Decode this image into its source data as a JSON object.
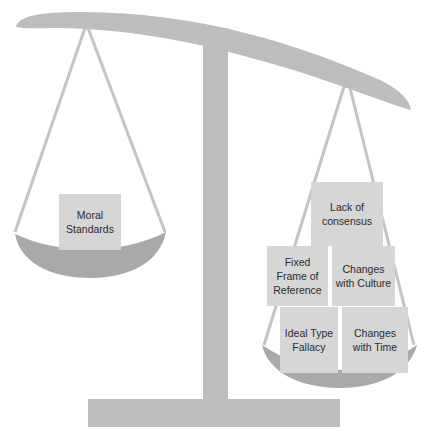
{
  "diagram": {
    "type": "balance-scale",
    "colors": {
      "structure": "#bdbdbd",
      "bowl": "#a9a9a9",
      "box": "#d6d6d6",
      "text": "#2b2b2b"
    },
    "left_pan": {
      "label": "Moral Standards",
      "boxes": [
        {
          "text": "Moral Standards"
        }
      ]
    },
    "right_pan": {
      "boxes": [
        {
          "text": "Lack of consensus"
        },
        {
          "text": "Fixed Frame of Reference"
        },
        {
          "text": "Changes with Culture"
        },
        {
          "text": "Ideal Type Fallacy"
        },
        {
          "text": "Changes with Time"
        }
      ]
    }
  }
}
